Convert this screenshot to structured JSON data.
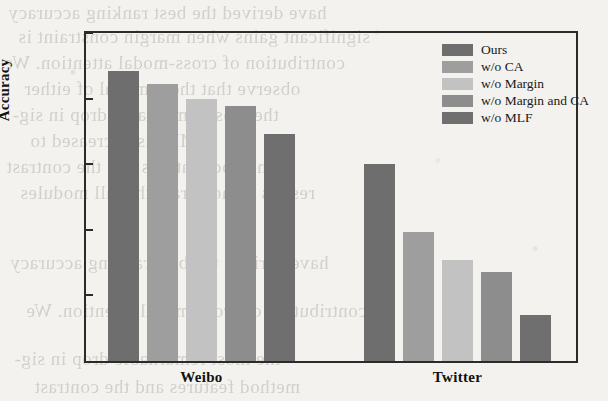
{
  "chart_data": {
    "type": "bar",
    "title": "",
    "xlabel": "",
    "ylabel": "Accuracy",
    "ylim": [
      0.7,
      0.95
    ],
    "yticks": [
      "0.95",
      "0.90",
      "0.85",
      "0.80",
      "0.75",
      "0.70"
    ],
    "ytick_values": [
      0.95,
      0.9,
      0.85,
      0.8,
      0.75,
      0.7
    ],
    "categories": [
      "Weibo",
      "Twitter"
    ],
    "grid": false,
    "legend_position": "top-right inside axes",
    "series": [
      {
        "name": "Ours",
        "color": "#6e6e6e",
        "values": [
          0.921,
          0.85
        ]
      },
      {
        "name": "w/o CA",
        "color": "#9e9e9e",
        "values": [
          0.911,
          0.798
        ]
      },
      {
        "name": "w/o Margin",
        "color": "#c2c2c2",
        "values": [
          0.9,
          0.777
        ]
      },
      {
        "name": "w/o Margin and CA",
        "color": "#8d8d8d",
        "values": [
          0.894,
          0.768
        ]
      },
      {
        "name": "w/o MLF",
        "color": "#6f6f6f",
        "values": [
          0.873,
          0.735
        ]
      }
    ]
  },
  "axes": {
    "frame_color": "#2b2b2b"
  },
  "background_bleed": [
    "have derived the best ranking accuracy",
    "significant gains when margin constraint is",
    "contribution of cross-modal attention. We",
    "observe that the removal of either",
    "the most remarkable drop in sig-",
    "MLF is decreased to",
    "method features and the contrast",
    "results demonstrate that all modules"
  ]
}
